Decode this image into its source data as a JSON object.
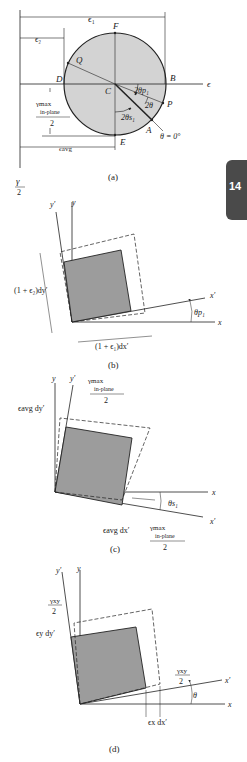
{
  "figure_a": {
    "caption": "(a)",
    "labels": {
      "eps1": "ϵ₁",
      "eps2": "ϵ₂",
      "F": "F",
      "Q": "Q",
      "D": "D",
      "C": "C",
      "B": "B",
      "eps_axis": "ϵ",
      "two_theta_p1": "2θp₁",
      "two_theta": "2θ",
      "P": "P",
      "two_theta_s1": "2θs₁",
      "A": "A",
      "theta_zero": "θ = 0°",
      "E": "E",
      "eps_avg": "ϵavg",
      "gamma_max_top": "γmax",
      "gamma_max_sub": "in-plane",
      "gamma_max_den": "2",
      "gamma_axis_num": "γ",
      "gamma_axis_den": "2"
    },
    "colors": {
      "circle_fill": "#d3d3d3",
      "line": "#222222"
    }
  },
  "chapter_tab": {
    "number": "14",
    "color": "#4a4a4a"
  },
  "figure_b": {
    "caption": "(b)",
    "labels": {
      "y_prime": "y′",
      "y": "y",
      "dy": "(1 + ϵ₂)dy′",
      "dx": "(1 + ϵ₁)dx′",
      "x_prime": "x′",
      "x": "x",
      "theta_p1": "θp₁"
    }
  },
  "figure_c": {
    "caption": "(c)",
    "labels": {
      "y": "y",
      "y_prime": "y′",
      "gamma_top": "γmax",
      "gamma_sub": "in-plane",
      "gamma_den": "2",
      "eavg_dy": "ϵavg dy′",
      "x": "x",
      "theta_s1": "θs₁",
      "x_prime": "x′",
      "eavg_dx": "ϵavg dx′",
      "gamma2_top": "γmax",
      "gamma2_sub": "in-plane",
      "gamma2_den": "2"
    }
  },
  "figure_d": {
    "caption": "(d)",
    "labels": {
      "y_prime": "y′",
      "y": "y",
      "gxy_num": "γxy",
      "gxy_den": "2",
      "ey_dy": "ϵy dy′",
      "gxy2_num": "γxy",
      "gxy2_den": "2",
      "x_prime": "x′",
      "theta": "θ",
      "x": "x",
      "ex_dx": "ϵx dx′"
    }
  }
}
